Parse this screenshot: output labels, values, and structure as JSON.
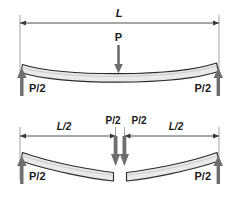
{
  "figure": {
    "title": "",
    "background_color": "#ffffff",
    "line_color": "#1a1a1a",
    "beam_fill_color": "#e9e9e9",
    "beam_stroke_color": "#2b2b2b",
    "arrow_fill_color": "#6e6e6e",
    "dimension_color": "#3a3a3a"
  },
  "top_diagram": {
    "name": "three-point-bending",
    "span_label": "L",
    "load_label": "P",
    "reaction_left_label": "P/2",
    "reaction_right_label": "P/2"
  },
  "bottom_diagram": {
    "name": "four-point-bending",
    "span_left_label": "L/2",
    "span_right_label": "L/2",
    "load_left_label": "P/2",
    "load_right_label": "P/2",
    "reaction_left_label": "P/2",
    "reaction_right_label": "P/2"
  }
}
